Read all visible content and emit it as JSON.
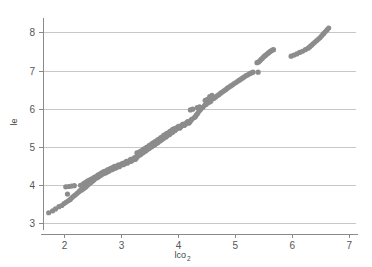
{
  "chart_data": {
    "type": "scatter",
    "title": "",
    "subtitle": "",
    "xlabel": "lco",
    "xlabel_sub": "2",
    "ylabel": "le",
    "xlim": [
      1.62,
      7.12
    ],
    "ylim": [
      2.88,
      8.34
    ],
    "xticks": [
      2,
      3,
      4,
      5,
      6,
      7
    ],
    "yticks": [
      3,
      4,
      5,
      6,
      7,
      8
    ],
    "xtick_labels": [
      "2",
      "3",
      "4",
      "5",
      "6",
      "7"
    ],
    "ytick_labels": [
      "3",
      "4",
      "5",
      "6",
      "7",
      "8"
    ],
    "grid": "horizontal",
    "legend": "none",
    "marker_color": "#8c8c8c",
    "marker_size": 2.6,
    "series_name": "observations",
    "annotations": [],
    "points": [
      [
        1.72,
        3.28
      ],
      [
        1.79,
        3.33
      ],
      [
        1.84,
        3.38
      ],
      [
        1.9,
        3.44
      ],
      [
        1.95,
        3.47
      ],
      [
        1.99,
        3.52
      ],
      [
        2.03,
        3.56
      ],
      [
        2.07,
        3.6
      ],
      [
        2.1,
        3.63
      ],
      [
        2.13,
        3.68
      ],
      [
        2.16,
        3.72
      ],
      [
        2.05,
        3.77
      ],
      [
        2.19,
        3.75
      ],
      [
        2.22,
        3.79
      ],
      [
        2.25,
        3.83
      ],
      [
        2.02,
        3.96
      ],
      [
        2.07,
        3.97
      ],
      [
        2.12,
        3.98
      ],
      [
        2.17,
        3.99
      ],
      [
        2.27,
        3.86
      ],
      [
        2.3,
        3.88
      ],
      [
        2.33,
        3.91
      ],
      [
        2.28,
        4.0
      ],
      [
        2.32,
        4.02
      ],
      [
        2.36,
        3.94
      ],
      [
        2.38,
        3.97
      ],
      [
        2.34,
        4.05
      ],
      [
        2.37,
        4.08
      ],
      [
        2.4,
        4.0
      ],
      [
        2.42,
        4.03
      ],
      [
        2.4,
        4.11
      ],
      [
        2.43,
        4.13
      ],
      [
        2.45,
        4.06
      ],
      [
        2.47,
        4.09
      ],
      [
        2.46,
        4.16
      ],
      [
        2.49,
        4.18
      ],
      [
        2.5,
        4.12
      ],
      [
        2.52,
        4.15
      ],
      [
        2.52,
        4.21
      ],
      [
        2.55,
        4.23
      ],
      [
        2.54,
        4.18
      ],
      [
        2.57,
        4.2
      ],
      [
        2.58,
        4.26
      ],
      [
        2.6,
        4.28
      ],
      [
        2.59,
        4.22
      ],
      [
        2.62,
        4.25
      ],
      [
        2.63,
        4.3
      ],
      [
        2.65,
        4.33
      ],
      [
        2.64,
        4.27
      ],
      [
        2.67,
        4.3
      ],
      [
        2.68,
        4.35
      ],
      [
        2.7,
        4.37
      ],
      [
        2.71,
        4.32
      ],
      [
        2.73,
        4.34
      ],
      [
        2.74,
        4.39
      ],
      [
        2.76,
        4.41
      ],
      [
        2.77,
        4.36
      ],
      [
        2.79,
        4.39
      ],
      [
        2.8,
        4.43
      ],
      [
        2.82,
        4.45
      ],
      [
        2.83,
        4.41
      ],
      [
        2.85,
        4.43
      ],
      [
        2.86,
        4.48
      ],
      [
        2.88,
        4.5
      ],
      [
        2.89,
        4.45
      ],
      [
        2.91,
        4.47
      ],
      [
        2.93,
        4.52
      ],
      [
        2.95,
        4.54
      ],
      [
        2.96,
        4.49
      ],
      [
        2.98,
        4.52
      ],
      [
        3.0,
        4.56
      ],
      [
        3.02,
        4.58
      ],
      [
        3.03,
        4.54
      ],
      [
        3.05,
        4.56
      ],
      [
        3.07,
        4.61
      ],
      [
        3.09,
        4.63
      ],
      [
        3.1,
        4.58
      ],
      [
        3.12,
        4.61
      ],
      [
        3.14,
        4.65
      ],
      [
        3.16,
        4.68
      ],
      [
        3.17,
        4.63
      ],
      [
        3.19,
        4.66
      ],
      [
        3.21,
        4.7
      ],
      [
        3.23,
        4.73
      ],
      [
        3.24,
        4.68
      ],
      [
        3.26,
        4.71
      ],
      [
        3.28,
        4.76
      ],
      [
        3.3,
        4.78
      ],
      [
        3.27,
        4.85
      ],
      [
        3.31,
        4.87
      ],
      [
        3.33,
        4.8
      ],
      [
        3.35,
        4.83
      ],
      [
        3.34,
        4.9
      ],
      [
        3.37,
        4.92
      ],
      [
        3.38,
        4.86
      ],
      [
        3.4,
        4.88
      ],
      [
        3.39,
        4.95
      ],
      [
        3.42,
        4.97
      ],
      [
        3.43,
        4.91
      ],
      [
        3.45,
        4.94
      ],
      [
        3.44,
        5.0
      ],
      [
        3.47,
        5.02
      ],
      [
        3.48,
        4.96
      ],
      [
        3.5,
        4.99
      ],
      [
        3.49,
        5.05
      ],
      [
        3.52,
        5.07
      ],
      [
        3.53,
        5.01
      ],
      [
        3.55,
        5.04
      ],
      [
        3.54,
        5.1
      ],
      [
        3.57,
        5.12
      ],
      [
        3.58,
        5.06
      ],
      [
        3.6,
        5.09
      ],
      [
        3.59,
        5.15
      ],
      [
        3.62,
        5.17
      ],
      [
        3.63,
        5.11
      ],
      [
        3.65,
        5.14
      ],
      [
        3.64,
        5.2
      ],
      [
        3.67,
        5.22
      ],
      [
        3.68,
        5.17
      ],
      [
        3.7,
        5.19
      ],
      [
        3.69,
        5.25
      ],
      [
        3.72,
        5.27
      ],
      [
        3.73,
        5.22
      ],
      [
        3.75,
        5.25
      ],
      [
        3.74,
        5.31
      ],
      [
        3.77,
        5.33
      ],
      [
        3.78,
        5.27
      ],
      [
        3.8,
        5.3
      ],
      [
        3.79,
        5.36
      ],
      [
        3.82,
        5.38
      ],
      [
        3.84,
        5.33
      ],
      [
        3.86,
        5.36
      ],
      [
        3.85,
        5.42
      ],
      [
        3.88,
        5.44
      ],
      [
        3.89,
        5.39
      ],
      [
        3.91,
        5.41
      ],
      [
        3.9,
        5.47
      ],
      [
        3.93,
        5.49
      ],
      [
        3.94,
        5.44
      ],
      [
        3.96,
        5.47
      ],
      [
        3.98,
        5.52
      ],
      [
        4.0,
        5.55
      ],
      [
        4.02,
        5.5
      ],
      [
        4.04,
        5.53
      ],
      [
        4.06,
        5.58
      ],
      [
        4.08,
        5.61
      ],
      [
        4.1,
        5.57
      ],
      [
        4.12,
        5.6
      ],
      [
        4.14,
        5.64
      ],
      [
        4.16,
        5.67
      ],
      [
        4.18,
        5.63
      ],
      [
        4.2,
        5.66
      ],
      [
        4.22,
        5.71
      ],
      [
        4.24,
        5.74
      ],
      [
        4.21,
        5.98
      ],
      [
        4.25,
        6.0
      ],
      [
        4.28,
        5.78
      ],
      [
        4.3,
        5.81
      ],
      [
        4.32,
        5.86
      ],
      [
        4.34,
        5.89
      ],
      [
        4.36,
        5.95
      ],
      [
        4.38,
        5.98
      ],
      [
        4.33,
        6.04
      ],
      [
        4.37,
        6.06
      ],
      [
        4.4,
        6.02
      ],
      [
        4.43,
        6.05
      ],
      [
        4.46,
        6.1
      ],
      [
        4.49,
        6.13
      ],
      [
        4.47,
        6.23
      ],
      [
        4.51,
        6.26
      ],
      [
        4.54,
        6.18
      ],
      [
        4.57,
        6.21
      ],
      [
        4.55,
        6.33
      ],
      [
        4.59,
        6.36
      ],
      [
        4.62,
        6.28
      ],
      [
        4.65,
        6.31
      ],
      [
        4.68,
        6.35
      ],
      [
        4.71,
        6.38
      ],
      [
        4.74,
        6.42
      ],
      [
        4.77,
        6.45
      ],
      [
        4.8,
        6.48
      ],
      [
        4.83,
        6.51
      ],
      [
        4.86,
        6.55
      ],
      [
        4.89,
        6.58
      ],
      [
        4.92,
        6.61
      ],
      [
        4.95,
        6.64
      ],
      [
        4.98,
        6.67
      ],
      [
        5.01,
        6.7
      ],
      [
        5.04,
        6.73
      ],
      [
        5.07,
        6.76
      ],
      [
        5.1,
        6.79
      ],
      [
        5.13,
        6.82
      ],
      [
        5.16,
        6.85
      ],
      [
        5.19,
        6.88
      ],
      [
        5.22,
        6.9
      ],
      [
        5.25,
        6.93
      ],
      [
        5.28,
        6.95
      ],
      [
        5.31,
        6.97
      ],
      [
        5.4,
        6.97
      ],
      [
        5.38,
        7.22
      ],
      [
        5.41,
        7.24
      ],
      [
        5.43,
        7.27
      ],
      [
        5.45,
        7.3
      ],
      [
        5.47,
        7.33
      ],
      [
        5.49,
        7.36
      ],
      [
        5.51,
        7.39
      ],
      [
        5.53,
        7.41
      ],
      [
        5.55,
        7.44
      ],
      [
        5.57,
        7.46
      ],
      [
        5.59,
        7.49
      ],
      [
        5.61,
        7.51
      ],
      [
        5.63,
        7.53
      ],
      [
        5.65,
        7.55
      ],
      [
        5.67,
        7.56
      ],
      [
        5.98,
        7.39
      ],
      [
        6.03,
        7.42
      ],
      [
        6.08,
        7.45
      ],
      [
        6.13,
        7.49
      ],
      [
        6.18,
        7.52
      ],
      [
        6.23,
        7.56
      ],
      [
        6.28,
        7.6
      ],
      [
        6.31,
        7.64
      ],
      [
        6.34,
        7.68
      ],
      [
        6.37,
        7.72
      ],
      [
        6.4,
        7.76
      ],
      [
        6.43,
        7.8
      ],
      [
        6.46,
        7.84
      ],
      [
        6.49,
        7.88
      ],
      [
        6.52,
        7.93
      ],
      [
        6.55,
        7.98
      ],
      [
        6.58,
        8.03
      ],
      [
        6.61,
        8.08
      ],
      [
        6.64,
        8.13
      ]
    ]
  },
  "figure": {
    "background_color": "#ffffff",
    "axis_color": "#8a8a8a",
    "grid_color": "#b9b9b9",
    "tick_text_color": "#555555"
  }
}
